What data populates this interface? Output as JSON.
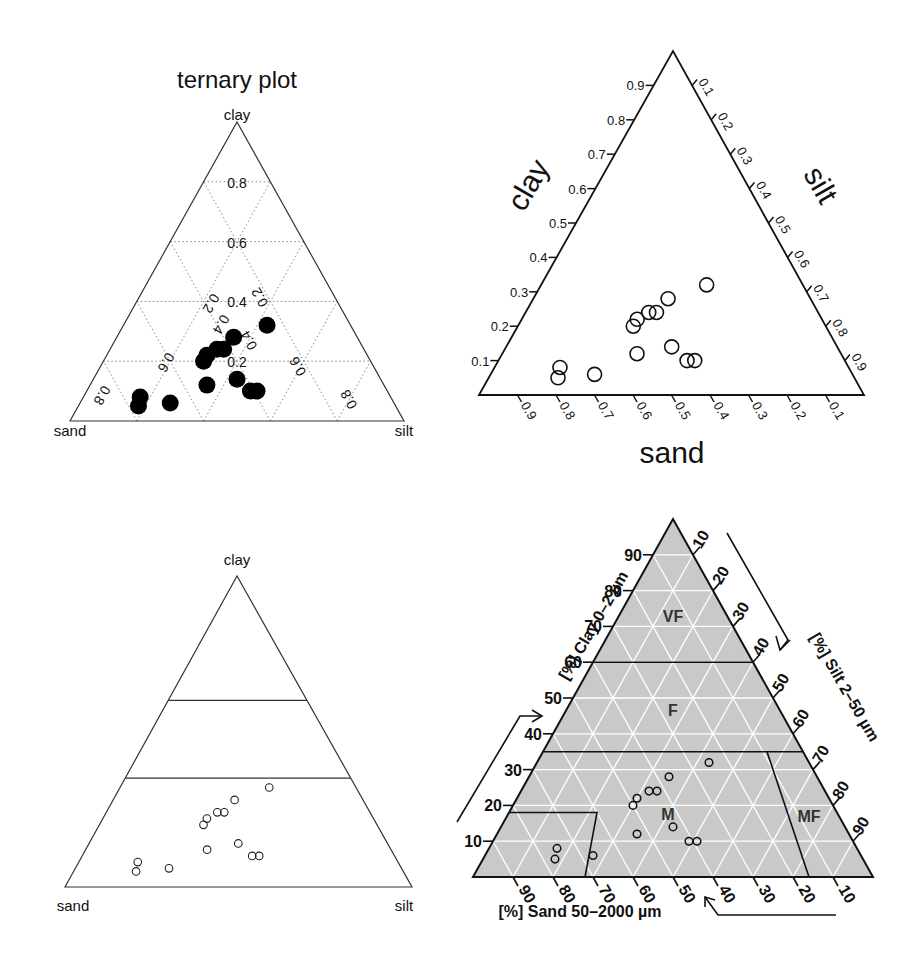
{
  "chart_data": [
    {
      "type": "scatter",
      "subtype": "ternary",
      "title": "ternary plot",
      "vertex_labels": {
        "top": "clay",
        "left": "sand",
        "right": "silt"
      },
      "grid": true,
      "grid_ticks": [
        "0.2",
        "0.4",
        "0.6",
        "0.8"
      ],
      "marker": "filled-circle",
      "points": [
        {
          "sand": 0.25,
          "silt": 0.43,
          "clay": 0.32
        },
        {
          "sand": 0.37,
          "silt": 0.35,
          "clay": 0.28
        },
        {
          "sand": 0.44,
          "silt": 0.32,
          "clay": 0.24
        },
        {
          "sand": 0.42,
          "silt": 0.34,
          "clay": 0.24
        },
        {
          "sand": 0.48,
          "silt": 0.3,
          "clay": 0.22
        },
        {
          "sand": 0.5,
          "silt": 0.3,
          "clay": 0.2
        },
        {
          "sand": 0.43,
          "silt": 0.43,
          "clay": 0.14
        },
        {
          "sand": 0.53,
          "silt": 0.35,
          "clay": 0.12
        },
        {
          "sand": 0.41,
          "silt": 0.49,
          "clay": 0.1
        },
        {
          "sand": 0.39,
          "silt": 0.51,
          "clay": 0.1
        },
        {
          "sand": 0.75,
          "silt": 0.17,
          "clay": 0.08
        },
        {
          "sand": 0.77,
          "silt": 0.18,
          "clay": 0.05
        },
        {
          "sand": 0.67,
          "silt": 0.27,
          "clay": 0.06
        }
      ]
    },
    {
      "type": "scatter",
      "subtype": "ternary",
      "axis_labels": {
        "left": "clay",
        "right": "silt",
        "bottom": "sand"
      },
      "clay_ticks": [
        "0.1",
        "0.2",
        "0.3",
        "0.4",
        "0.5",
        "0.6",
        "0.7",
        "0.8",
        "0.9"
      ],
      "silt_ticks": [
        "0.1",
        "0.2",
        "0.3",
        "0.4",
        "0.5",
        "0.6",
        "0.7",
        "0.8",
        "0.9"
      ],
      "sand_ticks": [
        "0.9",
        "0.8",
        "0.7",
        "0.6",
        "0.5",
        "0.4",
        "0.3",
        "0.2",
        "0.1"
      ],
      "marker": "open-circle",
      "points": "same as panel 1"
    },
    {
      "type": "scatter",
      "subtype": "ternary",
      "vertex_labels": {
        "top": "clay",
        "left": "sand",
        "right": "silt"
      },
      "class_boundaries_clay": [
        0.35,
        0.6
      ],
      "marker": "open-circle-small",
      "points": "same as panel 1"
    },
    {
      "type": "scatter",
      "subtype": "ternary-texture-classes",
      "axis_labels": {
        "left": "[%] Clay 0–2 µm",
        "right": "[%] Silt 2–50 µm",
        "bottom": "[%] Sand 50–2000 µm"
      },
      "clay_ticks": [
        "10",
        "20",
        "30",
        "40",
        "50",
        "60",
        "70",
        "80",
        "90"
      ],
      "silt_ticks": [
        "10",
        "20",
        "30",
        "40",
        "50",
        "60",
        "70",
        "80",
        "90"
      ],
      "sand_ticks": [
        "90",
        "80",
        "70",
        "60",
        "50",
        "40",
        "30",
        "20",
        "10"
      ],
      "regions": [
        "VF",
        "F",
        "M",
        "MF"
      ],
      "background": "#c8c8c8",
      "grid_color": "#ffffff",
      "marker": "open-circle-small",
      "points": "same as panel 1 (percent)"
    }
  ],
  "labels": {
    "p1_title": "ternary plot",
    "p1_clay": "clay",
    "p1_sand": "sand",
    "p1_silt": "silt",
    "p2_clay": "clay",
    "p2_silt": "silt",
    "p2_sand": "sand",
    "p3_clay": "clay",
    "p3_sand": "sand",
    "p3_silt": "silt",
    "p4_clay": "[%] Clay 0–2 µm",
    "p4_silt": "[%] Silt 2–50 µm",
    "p4_sand": "[%] Sand 50–2000 µm",
    "p4_vf": "VF",
    "p4_f": "F",
    "p4_m": "M",
    "p4_mf": "MF"
  }
}
